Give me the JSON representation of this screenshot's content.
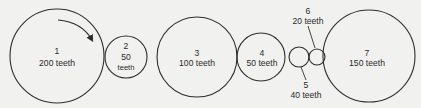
{
  "diagram": {
    "type": "gear-train",
    "colors": {
      "background": "#f1f1ef",
      "stroke": "#2e2e2e",
      "text": "#2a2a2a"
    },
    "rotation_arrow": {
      "on_gear": "1",
      "direction": "clockwise"
    },
    "gears": [
      {
        "id": "1",
        "number": "1",
        "teeth_label": "200 teeth",
        "cx": 57,
        "cy": 56,
        "r": 47
      },
      {
        "id": "2",
        "number": "2",
        "teeth_count": "50",
        "teeth_word": "teeth",
        "cx": 126,
        "cy": 57,
        "r": 21
      },
      {
        "id": "3",
        "number": "3",
        "teeth_label": "100 teeth",
        "cx": 197,
        "cy": 57,
        "r": 40
      },
      {
        "id": "4",
        "number": "4",
        "teeth_label": "50 teeth",
        "cx": 261,
        "cy": 57,
        "r": 24
      },
      {
        "id": "5",
        "number": "5",
        "teeth_label": "40 teeth",
        "cx": 299,
        "cy": 57,
        "r": 10
      },
      {
        "id": "6",
        "number": "6",
        "teeth_label": "20 teeth",
        "cx": 317,
        "cy": 57,
        "r": 8
      },
      {
        "id": "7",
        "number": "7",
        "teeth_label": "150 teeth",
        "cx": 369,
        "cy": 56,
        "r": 46
      }
    ]
  }
}
